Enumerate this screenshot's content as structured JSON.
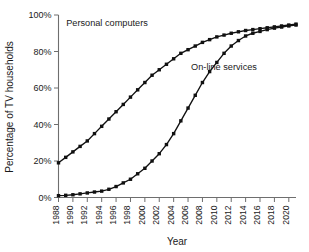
{
  "chart_data": {
    "type": "line",
    "title": "",
    "xlabel": "Year",
    "ylabel": "Percentage of TV households",
    "xlim": [
      1988,
      2021
    ],
    "ylim": [
      0,
      100
    ],
    "grid": false,
    "legend_position": "inline-annotations",
    "ytick_labels": [
      "0%",
      "20%",
      "40%",
      "60%",
      "80%",
      "100%"
    ],
    "ytick_values": [
      0,
      20,
      40,
      60,
      80,
      100
    ],
    "xtick_labels": [
      "1988",
      "1990",
      "1992",
      "1994",
      "1996",
      "1998",
      "2000",
      "2002",
      "2004",
      "2006",
      "2008",
      "2010",
      "2012",
      "2014",
      "2016",
      "2018",
      "2020"
    ],
    "xtick_values": [
      1988,
      1990,
      1992,
      1994,
      1996,
      1998,
      2000,
      2002,
      2004,
      2006,
      2008,
      2010,
      2012,
      2014,
      2016,
      2018,
      2020
    ],
    "x": [
      1988,
      1989,
      1990,
      1991,
      1992,
      1993,
      1994,
      1995,
      1996,
      1997,
      1998,
      1999,
      2000,
      2001,
      2002,
      2003,
      2004,
      2005,
      2006,
      2007,
      2008,
      2009,
      2010,
      2011,
      2012,
      2013,
      2014,
      2015,
      2016,
      2017,
      2018,
      2019,
      2020,
      2021
    ],
    "series": [
      {
        "name": "Personal computers",
        "marker": "square",
        "color": "#111111",
        "values": [
          19,
          22,
          25,
          28,
          31,
          35,
          39,
          43,
          47,
          51,
          55,
          59,
          63,
          67,
          70,
          73,
          76,
          79,
          81,
          83,
          85,
          86.5,
          88,
          89,
          90,
          90.8,
          91.5,
          92,
          92.5,
          93,
          93.5,
          94,
          94.5,
          95
        ]
      },
      {
        "name": "On-line services",
        "marker": "square",
        "color": "#111111",
        "values": [
          1,
          1.2,
          1.5,
          2,
          2.5,
          3,
          3.5,
          4.5,
          6,
          8,
          10,
          13,
          16,
          20,
          24,
          29,
          35,
          42,
          49,
          56,
          63,
          69,
          74,
          79,
          83,
          86,
          88.5,
          90,
          91,
          92,
          92.8,
          93.4,
          94,
          94.5
        ]
      }
    ],
    "annotations": [
      {
        "text": "Personal computers",
        "x_px": 107,
        "y_px": 26
      },
      {
        "text": "On-line services",
        "x_px": 224,
        "y_px": 70
      }
    ]
  },
  "axis": {
    "x_title": "Year",
    "y_title": "Percentage of TV households"
  }
}
